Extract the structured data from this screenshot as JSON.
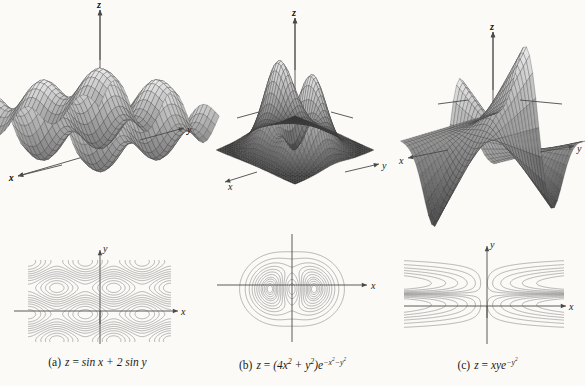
{
  "figure": {
    "background_color": "#fbfaf7",
    "ink_color": "#1a1a1a",
    "contour_color": "#8e8e8e",
    "mesh_color": "#3b3b3b",
    "axis_color": "#4a4a4a"
  },
  "panels": [
    {
      "key": "a",
      "caption_label": "(a)",
      "caption_lhs": "z",
      "caption_eq": "=",
      "caption_rhs": "sin x + 2 sin y",
      "surface_axes": {
        "x": "x",
        "y": "y",
        "z": "z"
      },
      "contour_axes": {
        "x": "x",
        "y": "y"
      }
    },
    {
      "key": "b",
      "caption_label": "(b)",
      "caption_lhs": "z",
      "caption_eq": "=",
      "caption_rhs": "(4x² + y²)e−x²−y²",
      "surface_axes": {
        "x": "x",
        "y": "y",
        "z": "z",
        "y2": "y"
      },
      "contour_axes": {
        "x": "x",
        "y": "y"
      }
    },
    {
      "key": "c",
      "caption_label": "(c)",
      "caption_lhs": "z",
      "caption_eq": "=",
      "caption_rhs": "xye−y²",
      "surface_axes": {
        "x": "x",
        "y": "y",
        "z": "z"
      },
      "contour_axes": {
        "x": "x",
        "y": "y"
      }
    }
  ],
  "chart_data": [
    {
      "type": "surface",
      "id": "surface-a",
      "title": "z = sin x + 2 sin y",
      "function": "sin(x) + 2*sin(y)",
      "xlabel": "x",
      "ylabel": "y",
      "zlabel": "z",
      "xlim": [
        -6.3,
        6.3
      ],
      "ylim": [
        -6.3,
        6.3
      ],
      "zlim": [
        -3,
        3
      ],
      "mesh": true,
      "grid": false,
      "projection": "3d-wireframe",
      "description": "Doubly periodic wavy surface with alternating ridges and troughs"
    },
    {
      "type": "surface",
      "id": "surface-b",
      "title": "z = (4x^2 + y^2)e^(-x^2-y^2)",
      "function": "(4*x^2 + y^2)*exp(-x^2-y^2)",
      "xlabel": "x",
      "ylabel": "y",
      "zlabel": "z",
      "xlim": [
        -2.5,
        2.5
      ],
      "ylim": [
        -2.5,
        2.5
      ],
      "zlim": [
        0,
        1.5
      ],
      "mesh": true,
      "grid": false,
      "projection": "3d-wireframe",
      "description": "Two symmetric peaks rising from a flat base plane"
    },
    {
      "type": "surface",
      "id": "surface-c",
      "title": "z = xye^(-y^2)",
      "function": "x*y*exp(-y^2)",
      "xlabel": "x",
      "ylabel": "y",
      "zlabel": "z",
      "xlim": [
        -2.5,
        2.5
      ],
      "ylim": [
        -2.5,
        2.5
      ],
      "zlim": [
        -0.8,
        0.8
      ],
      "mesh": true,
      "grid": false,
      "projection": "3d-wireframe",
      "description": "Twisted saddle surface with ridges along the x direction"
    },
    {
      "type": "contour",
      "id": "contour-a",
      "title": "z = sin x + 2 sin y",
      "function": "sin(x) + 2*sin(y)",
      "xlabel": "x",
      "ylabel": "y",
      "xlim": [
        -7.5,
        7.5
      ],
      "ylim": [
        -4.6,
        4.6
      ],
      "levels": [
        -2.7,
        -2.2,
        -1.7,
        -1.2,
        -0.7,
        -0.2,
        0.3,
        0.8,
        1.3,
        1.8,
        2.3,
        2.7
      ],
      "grid": false,
      "description": "Periodic checkerboard of closed oval contours separated by wavy bands"
    },
    {
      "type": "contour",
      "id": "contour-b",
      "title": "z = (4x^2 + y^2)e^(-x^2-y^2)",
      "function": "(4*x^2 + y^2)*exp(-x^2-y^2)",
      "xlabel": "x",
      "ylabel": "y",
      "xlim": [
        -3.2,
        3.2
      ],
      "ylim": [
        -2.6,
        2.6
      ],
      "levels": [
        0.08,
        0.2,
        0.35,
        0.5,
        0.65,
        0.8,
        0.95,
        1.1,
        1.2,
        1.3,
        1.38,
        1.43
      ],
      "grid": false,
      "description": "Nested closed curves forming a two-lobed dumbbell centred on the origin"
    },
    {
      "type": "contour",
      "id": "contour-c",
      "title": "z = xye^(-y^2)",
      "function": "x*y*exp(-y^2)",
      "xlabel": "x",
      "ylabel": "y",
      "xlim": [
        -3.6,
        3.6
      ],
      "ylim": [
        -2.4,
        2.4
      ],
      "levels": [
        -1.1,
        -0.8,
        -0.55,
        -0.35,
        -0.18,
        -0.07,
        0.07,
        0.18,
        0.35,
        0.55,
        0.8,
        1.1
      ],
      "grid": false,
      "description": "Hyperbola-like nested arcs opening left and right, mirrored across both axes"
    }
  ]
}
